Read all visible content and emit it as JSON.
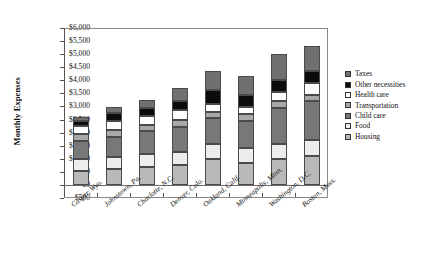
{
  "chart_data": {
    "type": "bar",
    "subtype": "stacked-bar",
    "title": "",
    "xlabel": "",
    "ylabel": "Monthly Expenses",
    "ylim": [
      -500,
      6000
    ],
    "ytick_step": 500,
    "ytick_labels": [
      "$6,000",
      "$5,500",
      "$5,000",
      "$4,500",
      "$4,000",
      "$3,500",
      "$3,000",
      "$2,500",
      "$2,000",
      "$1,500",
      "$1,000",
      "$500",
      "$0",
      "−$500"
    ],
    "ytick_values": [
      6000,
      5500,
      5000,
      4500,
      4000,
      3500,
      3000,
      2500,
      2000,
      1500,
      1000,
      500,
      0,
      -500
    ],
    "grid": false,
    "legend_position": "right",
    "categories": [
      "Casper, Wyo.",
      "Johnstown, Pa.",
      "Charlotte, N.C.",
      "Denver, Colo.",
      "Oakland, Calif.",
      "Minneapolis, Minn.",
      "Washington, D.C.",
      "Boston, Mass."
    ],
    "series": [
      {
        "name": "Housing",
        "color": "#b9b9b9",
        "values": [
          550,
          600,
          700,
          750,
          1000,
          850,
          1000,
          1100
        ]
      },
      {
        "name": "Food",
        "color": "#ededed",
        "values": [
          450,
          450,
          500,
          500,
          550,
          550,
          550,
          600
        ]
      },
      {
        "name": "Child care",
        "color": "#787878",
        "values": [
          700,
          800,
          850,
          950,
          1000,
          1050,
          1400,
          1500
        ]
      },
      {
        "name": "Transportation",
        "color": "#a8a8a8",
        "values": [
          250,
          250,
          250,
          300,
          250,
          250,
          250,
          250
        ]
      },
      {
        "name": "Health care",
        "color": "#ffffff",
        "values": [
          300,
          350,
          350,
          350,
          300,
          300,
          350,
          450
        ]
      },
      {
        "name": "Other necessities",
        "color": "#0c0c0c",
        "values": [
          200,
          300,
          300,
          350,
          550,
          450,
          450,
          450
        ]
      },
      {
        "name": "Taxes",
        "color": "#707070",
        "values": [
          150,
          250,
          300,
          500,
          700,
          700,
          1000,
          950
        ]
      }
    ],
    "totals": [
      2600,
      3000,
      3250,
      3700,
      4350,
      4150,
      5000,
      5300
    ],
    "legend_entries": [
      {
        "label": "Taxes",
        "color": "#707070"
      },
      {
        "label": "Other necessities",
        "color": "#0c0c0c"
      },
      {
        "label": "Health care",
        "color": "#ffffff"
      },
      {
        "label": "Transportation",
        "color": "#a8a8a8"
      },
      {
        "label": "Child care",
        "color": "#787878"
      },
      {
        "label": "Food",
        "color": "#ededed"
      },
      {
        "label": "Housing",
        "color": "#b9b9b9"
      }
    ]
  }
}
